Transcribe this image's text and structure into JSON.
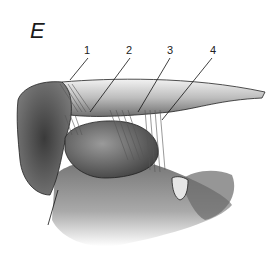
{
  "figure": {
    "panel_letter": "E",
    "labels": [
      {
        "id": "1",
        "text": "1",
        "x": 84,
        "y": 44
      },
      {
        "id": "2",
        "text": "2",
        "x": 126,
        "y": 44
      },
      {
        "id": "3",
        "text": "3",
        "x": 167,
        "y": 44
      },
      {
        "id": "4",
        "text": "4",
        "x": 210,
        "y": 44
      }
    ],
    "colors": {
      "ink": "#1a1a1a",
      "background": "#ffffff"
    }
  }
}
